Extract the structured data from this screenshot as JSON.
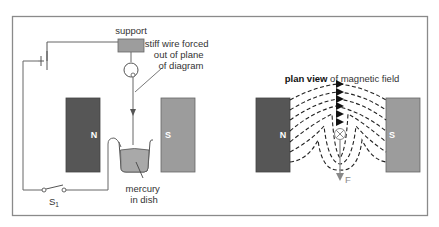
{
  "diagram": {
    "left_panel": {
      "labels": {
        "support": "support",
        "wire_line1": "stiff wire forced",
        "wire_line2": "out of plane",
        "wire_line3": "of diagram",
        "mercury_line1": "mercury",
        "mercury_line2": "in dish",
        "switch": "S",
        "switch_sub": "1"
      },
      "magnet_north": {
        "label": "N",
        "color": "#555555"
      },
      "magnet_south": {
        "label": "S",
        "color": "#9a9a9a"
      },
      "support_color": "#999999",
      "mercury_color": "#a8a8a8"
    },
    "right_panel": {
      "title_bold": "plan view",
      "title_rest": " of magnetic field",
      "magnet_north": {
        "label": "N",
        "color": "#555555"
      },
      "magnet_south": {
        "label": "S",
        "color": "#9a9a9a"
      },
      "wire_symbol": "⊗",
      "force_label": "F",
      "force_color": "#888888"
    },
    "frame_color": "#7a7a7a",
    "line_color": "#555555"
  }
}
